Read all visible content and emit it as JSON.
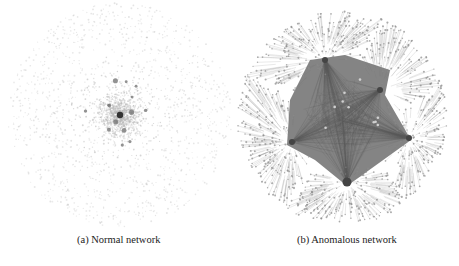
{
  "figure": {
    "panels": [
      {
        "id": "a",
        "caption": "(a) Normal network",
        "description": "Diffuse scatter of many small light-grey nodes with a denser core and a handful of larger hub nodes near the center",
        "center": [
          120,
          115
        ],
        "radius": 112,
        "node_count": 2600,
        "hub_count": 14,
        "node_color": "#b8b8b8",
        "hub_color": "#777777"
      },
      {
        "id": "b",
        "caption": "(b) Anomalous network",
        "description": "Dense dark-grey star-shaped core with hub nodes at its vertices, surrounded by a ring of small nodes connected by many edges",
        "center": [
          107,
          118
        ],
        "radius": 105,
        "node_count": 900,
        "hubs": [
          [
            112,
            182
          ],
          [
            174,
            138
          ],
          [
            57,
            142
          ],
          [
            90,
            60
          ],
          [
            145,
            90
          ]
        ],
        "core_color": "#6e6e6e",
        "edge_color": "#9a9a9a",
        "node_color": "#8a8a8a"
      }
    ]
  }
}
